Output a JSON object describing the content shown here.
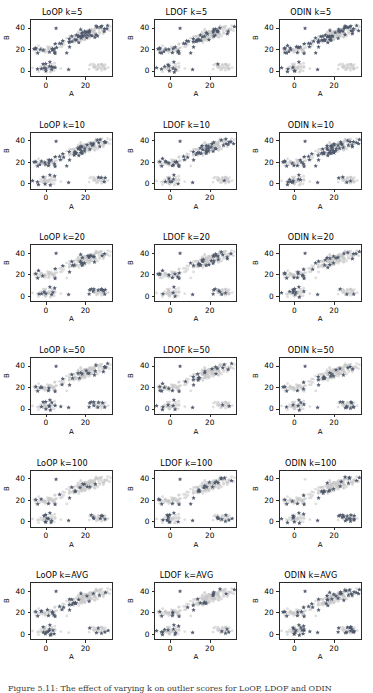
{
  "figure": {
    "title": "",
    "caption": "Figure 5.11: The effect of varying k on outlier scores for LoOP, LDOF and ODIN",
    "background_color": "#ffffff",
    "rows": 6,
    "columns": 3
  },
  "colors": {
    "outlier_marker": "#4c566a",
    "inlier_marker": "#c8c8c8",
    "axis": "#2a2a2a",
    "text": "#000000"
  },
  "axes_common": {
    "xlabel": "A",
    "ylabel": "B",
    "xticks": [
      "0",
      "20"
    ],
    "yticks": [
      "0",
      "20",
      "40"
    ],
    "xlim": [
      -8,
      34
    ],
    "ylim": [
      -6,
      48
    ],
    "grid": false,
    "legend": null
  },
  "methods": [
    "LoOP",
    "LDOF",
    "ODIN"
  ],
  "k_values": [
    "5",
    "10",
    "20",
    "50",
    "100",
    "AVG"
  ],
  "panels": [
    {
      "title": "LoOP k=5",
      "method": "LoOP",
      "k": "5"
    },
    {
      "title": "LDOF k=5",
      "method": "LDOF",
      "k": "5"
    },
    {
      "title": "ODIN k=5",
      "method": "ODIN",
      "k": "5"
    },
    {
      "title": "LoOP k=10",
      "method": "LoOP",
      "k": "10"
    },
    {
      "title": "LDOF k=10",
      "method": "LDOF",
      "k": "10"
    },
    {
      "title": "ODIN k=10",
      "method": "ODIN",
      "k": "10"
    },
    {
      "title": "LoOP k=20",
      "method": "LoOP",
      "k": "20"
    },
    {
      "title": "LDOF k=20",
      "method": "LDOF",
      "k": "20"
    },
    {
      "title": "ODIN k=20",
      "method": "ODIN",
      "k": "20"
    },
    {
      "title": "LoOP k=50",
      "method": "LoOP",
      "k": "50"
    },
    {
      "title": "LDOF k=50",
      "method": "LDOF",
      "k": "50"
    },
    {
      "title": "ODIN k=50",
      "method": "ODIN",
      "k": "50"
    },
    {
      "title": "LoOP k=100",
      "method": "LoOP",
      "k": "100"
    },
    {
      "title": "LDOF k=100",
      "method": "LDOF",
      "k": "100"
    },
    {
      "title": "ODIN k=100",
      "method": "ODIN",
      "k": "100"
    },
    {
      "title": "LoOP k=AVG",
      "method": "LoOP",
      "k": "AVG"
    },
    {
      "title": "LDOF k=AVG",
      "method": "LDOF",
      "k": "AVG"
    },
    {
      "title": "ODIN k=AVG",
      "method": "ODIN",
      "k": "AVG"
    }
  ],
  "chart_data": {
    "type": "scatter",
    "xlabel": "A",
    "ylabel": "B",
    "xlim": [
      -8,
      34
    ],
    "ylim": [
      -6,
      48
    ],
    "xticks": [
      0,
      20
    ],
    "yticks": [
      0,
      20,
      40
    ],
    "grid": false,
    "legend_position": "none",
    "series_styles": {
      "inliers": {
        "marker": "o",
        "color": "#c8c8c8",
        "size": 4,
        "alpha": 0.55
      },
      "outliers": {
        "marker": "*",
        "color": "#4c566a",
        "size": 9,
        "alpha": 0.95
      }
    },
    "clusters": [
      {
        "name": "cluster-left-mid",
        "center": [
          0.5,
          19.5
        ],
        "spread": [
          3.4,
          2.2
        ],
        "n_points": 46
      },
      {
        "name": "cluster-lower-left",
        "center": [
          0.2,
          1.6
        ],
        "spread": [
          2.6,
          2.0
        ],
        "n_points": 40
      },
      {
        "name": "cluster-upper-right",
        "center": [
          22.0,
          34.5
        ],
        "spread": [
          5.6,
          4.2
        ],
        "n_points": 150
      },
      {
        "name": "cluster-lower-right",
        "center": [
          27.5,
          3.5
        ],
        "spread": [
          2.4,
          1.8
        ],
        "n_points": 30
      }
    ],
    "scattered_outlier_points": [
      [
        5.0,
        40.0
      ],
      [
        11.5,
        0.2
      ],
      [
        -5.5,
        20.3
      ],
      [
        -4.5,
        16.2
      ],
      [
        1.0,
        16.5
      ],
      [
        4.5,
        15.8
      ],
      [
        1.8,
        7.5
      ],
      [
        12.0,
        22.0
      ]
    ],
    "panel_count": 18,
    "rows": 6,
    "cols": 3,
    "row_labels": [
      "k=5",
      "k=10",
      "k=20",
      "k=50",
      "k=100",
      "k=AVG"
    ],
    "col_labels": [
      "LoOP",
      "LDOF",
      "ODIN"
    ]
  }
}
